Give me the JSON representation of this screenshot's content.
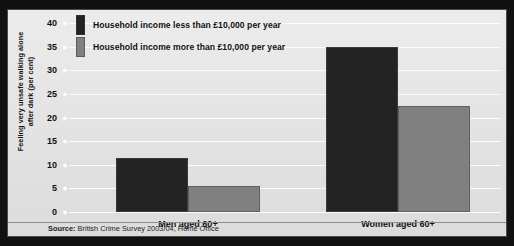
{
  "chart_data": {
    "type": "bar",
    "title": "",
    "subtitle": "",
    "xlabel": "",
    "ylabel": "Feeling very unsafe walking alone after dark (per cent)",
    "ylabel_line1": "Feeling very unsafe walking alone",
    "ylabel_line2": "after dark (per cent)",
    "categories": [
      "Men aged 60+",
      "Women aged 60+"
    ],
    "series": [
      {
        "name": "Household income less than £10,000 per year",
        "color": "#232323",
        "values": [
          11.5,
          35
        ]
      },
      {
        "name": "Household income more than £10,000 per year",
        "color": "#808080",
        "values": [
          5.5,
          22.5
        ]
      }
    ],
    "ylim": [
      0,
      40
    ],
    "yticks": [
      0,
      5,
      10,
      15,
      20,
      25,
      30,
      35,
      40
    ],
    "ytick_labels": [
      "0",
      "5",
      "10",
      "15",
      "20",
      "25",
      "30",
      "35",
      "40"
    ],
    "grid": true,
    "legend_position": "top-left",
    "source": "British Crime Survey 2003/04, Home Office"
  },
  "legend": {
    "items": [
      {
        "label": "Household income less than £10,000 per year",
        "swatch": "dark"
      },
      {
        "label": "Household income more than £10,000 per year",
        "swatch": "grey"
      }
    ]
  },
  "footer": {
    "source_prefix": "Source:",
    "source_text": "British Crime Survey 2003/04, Home Office"
  },
  "colors": {
    "series_low_income": "#232323",
    "series_high_income": "#808080",
    "panel_background": "#e7e7e7",
    "frame": "#000000",
    "gridline": "#fcfcfc"
  }
}
